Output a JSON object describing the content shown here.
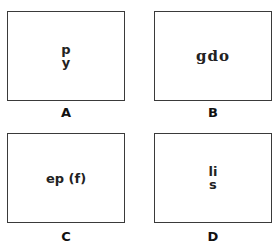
{
  "panels": [
    {
      "id": "A",
      "label": "A",
      "lines": [
        "p",
        "y"
      ],
      "style": "sans"
    },
    {
      "id": "B",
      "label": "B",
      "lines": [
        "gdo"
      ],
      "style": "serif"
    },
    {
      "id": "C",
      "label": "C",
      "lines": [
        "ep (f)"
      ],
      "style": "sans"
    },
    {
      "id": "D",
      "label": "D",
      "lines": [
        "li",
        "s"
      ],
      "style": "sans"
    }
  ]
}
